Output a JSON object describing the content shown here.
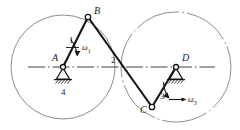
{
  "figure": {
    "type": "kinematic-linkage-diagram",
    "stroke_color": "#1a1a1a",
    "circle_color": "#8a8a8a",
    "background": "#ffffff",
    "width": 240,
    "height": 130
  },
  "points": {
    "A": {
      "label": "A",
      "x": 63,
      "y": 67,
      "kind": "fixed-pivot"
    },
    "B": {
      "label": "B",
      "x": 88,
      "y": 17,
      "kind": "pin-joint"
    },
    "C": {
      "label": "C",
      "x": 152,
      "y": 107,
      "kind": "pin-joint"
    },
    "D": {
      "label": "D",
      "x": 176,
      "y": 67,
      "kind": "fixed-pivot"
    }
  },
  "links": [
    {
      "id": "link1",
      "label": "1",
      "from": "A",
      "to": "B"
    },
    {
      "id": "link2",
      "label": "2",
      "from": "B",
      "to": "C"
    },
    {
      "id": "link3",
      "label": "3",
      "from": "C",
      "to": "D"
    },
    {
      "id": "link4",
      "label": "4",
      "from": "A",
      "to": "D",
      "note": "ground-frame"
    }
  ],
  "angular_velocities": [
    {
      "id": "omega1",
      "symbol": "ω",
      "subscript": "1",
      "at": "A"
    },
    {
      "id": "omega3",
      "symbol": "ω",
      "subscript": "3",
      "at": "D"
    }
  ],
  "circles": [
    {
      "id": "circle-left",
      "center": "A",
      "cx": 63,
      "cy": 67,
      "r": 52,
      "style": "solid"
    },
    {
      "id": "circle-right",
      "center": "D",
      "cx": 176,
      "cy": 67,
      "r": 55,
      "style": "dash-dot"
    }
  ],
  "centerline": {
    "id": "ground-centerline",
    "style": "dash-dot",
    "x1": 28,
    "y1": 67,
    "x2": 215,
    "y2": 67
  }
}
